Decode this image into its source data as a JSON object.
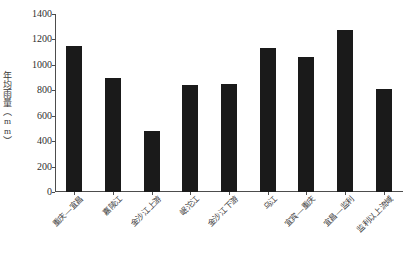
{
  "chart_data": {
    "type": "bar",
    "title": "",
    "xlabel": "",
    "ylabel": "年均雨量（mm）",
    "ylim": [
      0,
      1400
    ],
    "grid": false,
    "legend": "none",
    "bar_color": "#1a1a1a",
    "categories": [
      "重庆—宜昌",
      "嘉陵江",
      "金沙江上游",
      "岷沱江",
      "金沙江下游",
      "乌江",
      "宜宾—重庆",
      "宜昌—监利",
      "监利以上流域"
    ],
    "values": [
      1150,
      900,
      480,
      840,
      850,
      1130,
      1060,
      1275,
      810
    ],
    "yticks": [
      0,
      200,
      400,
      600,
      800,
      1000,
      1200,
      1400
    ],
    "ytick_labels": [
      "0",
      "200",
      "400",
      "600",
      "800",
      "1000",
      "1200",
      "1400"
    ]
  }
}
